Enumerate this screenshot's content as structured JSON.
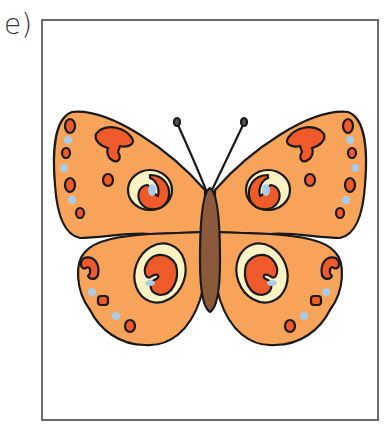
{
  "exercise": {
    "label": "e)"
  },
  "illustration": {
    "subject": "butterfly",
    "colors": {
      "wing": "#f7a35a",
      "spot": "#ee5a2a",
      "eye_ring": "#fdf3c4",
      "blue_dot": "#a9cde8",
      "body": "#8b5a3c",
      "outline": "#1a1a1a",
      "frame": "#6b6b6b"
    }
  }
}
